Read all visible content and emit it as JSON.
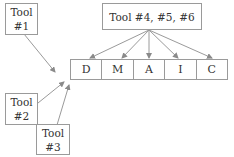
{
  "diagram": {
    "tools": [
      {
        "id": "tool1",
        "line1": "Tool",
        "line2": "#1"
      },
      {
        "id": "tool2",
        "line1": "Tool",
        "line2": "#2"
      },
      {
        "id": "tool3",
        "line1": "Tool",
        "line2": "#3"
      }
    ],
    "top_box": {
      "label": "Tool #4, #5, #6"
    },
    "phases": [
      {
        "label": "D"
      },
      {
        "label": "M"
      },
      {
        "label": "A"
      },
      {
        "label": "I"
      },
      {
        "label": "C"
      }
    ],
    "colors": {
      "line": "#9a9a9a",
      "text": "#333333",
      "background": "#ffffff"
    }
  }
}
